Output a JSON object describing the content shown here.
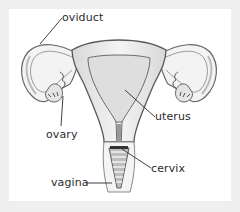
{
  "diagram": {
    "labels": {
      "oviduct": "oviduct",
      "ovary": "ovary",
      "uterus": "uterus",
      "cervix": "cervix",
      "vagina": "vagina"
    },
    "colors": {
      "frame": "#efefef",
      "panel": "#ffffff",
      "outline": "#555555",
      "tissue": "#e9e9e9",
      "cavity": "#dcdcdc",
      "leader": "#2b2b2b"
    }
  }
}
